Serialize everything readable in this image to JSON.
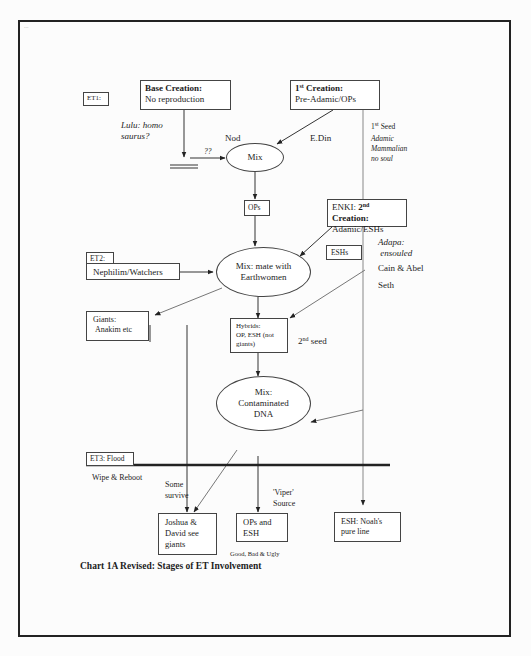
{
  "caption": "Chart 1A Revised:  Stages of ET Involvement",
  "watermark": "...",
  "stages": {
    "et1": "ET1:",
    "et2": "ET2:",
    "et3": "ET3: Flood"
  },
  "boxes": {
    "base_creation": {
      "title": "Base Creation:",
      "body": "No reproduction"
    },
    "first_creation": {
      "title_num": "1",
      "title_sup": "st",
      "title_rest": " Creation:",
      "body": "Pre-Adamic/OPs"
    },
    "ops": "OPs",
    "enki": {
      "prefix": "ENKI: ",
      "num": "2",
      "sup": "nd",
      "rest": " Creation:",
      "body": "Adamic/ESHs"
    },
    "eshs": "ESHs",
    "nephilim": "Nephilim/Watchers",
    "giants": {
      "line1": "Giants:",
      "line2": "Anakim etc"
    },
    "hybrids": {
      "line1": "Hybrids:",
      "line2": "OP, ESH (not",
      "line3": "giants)"
    },
    "joshua": {
      "line1": "Joshua &",
      "line2": "David see",
      "line3": "giants"
    },
    "ops_esh": {
      "line1": "OPs and",
      "line2": "ESH"
    },
    "noah": {
      "line1": "ESH: Noah's",
      "line2": "pure line"
    }
  },
  "ovals": {
    "mix1": "Mix",
    "mix2": {
      "line1": "Mix: mate with",
      "line2": "Earthwomen"
    },
    "mix3": {
      "line1": "Mix:",
      "line2": "Contaminated",
      "line3": "DNA"
    }
  },
  "labels": {
    "lulu": {
      "line1": "Lulu: homo",
      "line2": "saurus?"
    },
    "qq": "??",
    "nod": "Nod",
    "edin": "E.Din",
    "first_seed": {
      "num": "1",
      "sup": "st",
      "rest": " Seed"
    },
    "adamic": {
      "line1": "Adamic",
      "line2": "Mammalian",
      "line3": "no soul"
    },
    "adapa": {
      "line1": "Adapa:",
      "line2": "ensouled"
    },
    "cain_abel": "Cain & Abel",
    "seth": "Seth",
    "second_seed": {
      "num": "2",
      "sup": "nd",
      "rest": " seed"
    },
    "wipe": "Wipe & Reboot",
    "some_survive": {
      "line1": "Some",
      "line2": "survive"
    },
    "viper": {
      "line1": "'Viper'",
      "line2": "Source"
    },
    "good_bad": "Good, Bad & Ugly"
  }
}
